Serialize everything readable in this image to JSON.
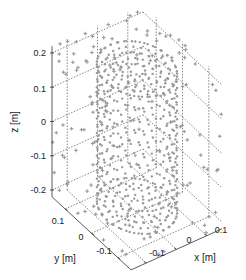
{
  "chart_data": {
    "type": "scatter",
    "title": "",
    "dimensions": 3,
    "xlabel": "x [m]",
    "ylabel": "y [m]",
    "zlabel": "z [m]",
    "xlim": [
      -0.15,
      0.15
    ],
    "ylim": [
      -0.15,
      0.15
    ],
    "zlim": [
      -0.22,
      0.22
    ],
    "x_ticks": [
      "-0.1",
      "0",
      "0.1"
    ],
    "y_ticks": [
      "0.1",
      "0",
      "-0.1"
    ],
    "z_ticks": [
      "0.2",
      "0.1",
      "0",
      "-0.1",
      "-0.2"
    ],
    "grid": true,
    "marker_color": "#9a9a9a",
    "series": [
      {
        "name": "cylinder surface points",
        "description": "dense points on a cylinder (radius ~0.1 m, z from -0.2 to 0.2) including concentric rings on top and bottom caps",
        "radius": 0.1,
        "z_range": [
          -0.2,
          0.2
        ],
        "cap_rings": [
          0.02,
          0.04,
          0.06,
          0.08,
          0.1
        ]
      },
      {
        "name": "outer box points",
        "description": "sparse '+' markers on the faces of the enclosing box",
        "marker": "+"
      }
    ]
  }
}
